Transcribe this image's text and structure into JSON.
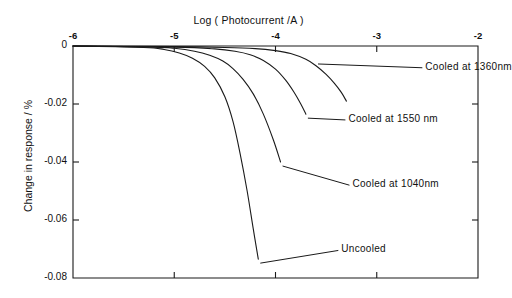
{
  "chart_data": {
    "type": "line",
    "title": "Log ( Photocurrent /A )",
    "xlabel": "Log ( Photocurrent /A )",
    "ylabel": "Change in response / %",
    "xlim": [
      -6,
      -2
    ],
    "ylim": [
      -0.08,
      0
    ],
    "xticks": [
      -6,
      -5,
      -4,
      -3,
      -2
    ],
    "xticklabels": [
      "-6",
      "-5",
      "-4",
      "-3",
      "-2"
    ],
    "yticks": [
      0,
      -0.02,
      -0.04,
      -0.06,
      -0.08
    ],
    "yticklabels": [
      "0",
      "-0.02",
      "-0.04",
      "-0.06",
      "-0.08"
    ],
    "grid": false,
    "legend_position": "inline-annotations",
    "xaxis_position": "top",
    "series": [
      {
        "name": "Cooled at 1360 nm",
        "label": "Cooled at 1360nm",
        "label_x": -2.52,
        "label_y": -0.0075,
        "x": [
          -6.0,
          -5.0,
          -4.5,
          -4.2,
          -4.0,
          -3.85,
          -3.7,
          -3.6,
          -3.5,
          -3.42,
          -3.35,
          -3.3
        ],
        "y": [
          0.0,
          -0.0002,
          -0.0005,
          -0.0009,
          -0.0016,
          -0.0026,
          -0.0046,
          -0.0068,
          -0.0098,
          -0.0128,
          -0.016,
          -0.019
        ]
      },
      {
        "name": "Cooled at 1550 nm",
        "label": "Cooled at 1550 nm",
        "label_x": -3.28,
        "label_y": -0.0255,
        "x": [
          -6.0,
          -5.0,
          -4.6,
          -4.4,
          -4.25,
          -4.12,
          -4.0,
          -3.9,
          -3.82,
          -3.75,
          -3.7
        ],
        "y": [
          0.0,
          -0.0004,
          -0.001,
          -0.0018,
          -0.003,
          -0.005,
          -0.008,
          -0.0118,
          -0.0158,
          -0.02,
          -0.0235
        ]
      },
      {
        "name": "Cooled at 1040 nm",
        "label": "Cooled at 1040nm",
        "label_x": -3.24,
        "label_y": -0.048,
        "x": [
          -6.0,
          -5.2,
          -5.0,
          -4.8,
          -4.65,
          -4.52,
          -4.42,
          -4.32,
          -4.22,
          -4.12,
          -4.02,
          -3.95
        ],
        "y": [
          0.0,
          -0.0004,
          -0.0008,
          -0.0018,
          -0.0032,
          -0.0052,
          -0.0078,
          -0.0115,
          -0.0165,
          -0.0235,
          -0.0325,
          -0.04
        ]
      },
      {
        "name": "Uncooled",
        "label": "Uncooled",
        "label_x": -3.35,
        "label_y": -0.0705,
        "x": [
          -6.0,
          -5.3,
          -5.1,
          -4.95,
          -4.82,
          -4.7,
          -4.6,
          -4.5,
          -4.42,
          -4.35,
          -4.28,
          -4.22,
          -4.17
        ],
        "y": [
          0.0,
          -0.0005,
          -0.0012,
          -0.0024,
          -0.0042,
          -0.007,
          -0.011,
          -0.0175,
          -0.026,
          -0.037,
          -0.05,
          -0.063,
          -0.0735
        ]
      }
    ]
  },
  "axes": {
    "title_text": "Log ( Photocurrent /A )",
    "y_title_text": "Change in response / %"
  }
}
